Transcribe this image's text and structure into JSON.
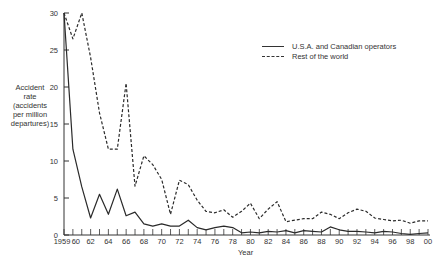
{
  "chart_data": {
    "type": "line",
    "title": "",
    "xlabel": "Year",
    "ylabel": "Accident rate (accidents per million departures)",
    "ylim": [
      0,
      30
    ],
    "yticks": [
      0,
      5,
      10,
      15,
      20,
      25,
      30
    ],
    "xtick_labels": [
      "1959",
      "60",
      "62",
      "64",
      "66",
      "68",
      "70",
      "72",
      "74",
      "76",
      "78",
      "80",
      "82",
      "84",
      "86",
      "88",
      "90",
      "92",
      "94",
      "96",
      "98",
      "00"
    ],
    "x": [
      1959,
      1960,
      1961,
      1962,
      1963,
      1964,
      1965,
      1966,
      1967,
      1968,
      1969,
      1970,
      1971,
      1972,
      1973,
      1974,
      1975,
      1976,
      1977,
      1978,
      1979,
      1980,
      1981,
      1982,
      1983,
      1984,
      1985,
      1986,
      1987,
      1988,
      1989,
      1990,
      1991,
      1992,
      1993,
      1994,
      1995,
      1996,
      1997,
      1998,
      1999,
      2000
    ],
    "series": [
      {
        "name": "U.S.A. and Canadian operators",
        "style": "solid",
        "values": [
          30,
          11.6,
          6.5,
          2.3,
          5.5,
          2.8,
          6.2,
          2.6,
          3.1,
          1.5,
          1.2,
          1.5,
          1.2,
          1.2,
          2.0,
          1.0,
          0.7,
          1.0,
          1.2,
          1.0,
          0.3,
          0.4,
          0.3,
          0.5,
          0.4,
          0.6,
          0.3,
          0.6,
          0.5,
          0.4,
          1.1,
          0.7,
          0.5,
          0.5,
          0.4,
          0.3,
          0.5,
          0.4,
          0.2,
          0.1,
          0.2,
          0.3
        ]
      },
      {
        "name": "Rest of the world",
        "style": "dashed",
        "values": [
          30,
          26.5,
          30,
          24,
          16.5,
          11.6,
          11.6,
          20.5,
          6.6,
          10.7,
          9.5,
          7.5,
          2.8,
          7.4,
          6.8,
          4.7,
          3.2,
          3.0,
          3.4,
          2.4,
          3.2,
          4.3,
          2.2,
          3.5,
          4.5,
          1.8,
          2.0,
          2.2,
          2.2,
          3.1,
          2.8,
          2.2,
          3.0,
          3.5,
          3.2,
          2.3,
          2.1,
          1.9,
          2.0,
          1.6,
          1.9,
          1.9
        ]
      }
    ],
    "legend_position": "upper right",
    "grid": false
  },
  "labels": {
    "ylabel_lines": [
      "Accident",
      "rate",
      "(accidents",
      "per million",
      "departures)"
    ],
    "xlabel": "Year",
    "legend": [
      "U.S.A. and Canadian operators",
      "Rest of the world"
    ]
  }
}
